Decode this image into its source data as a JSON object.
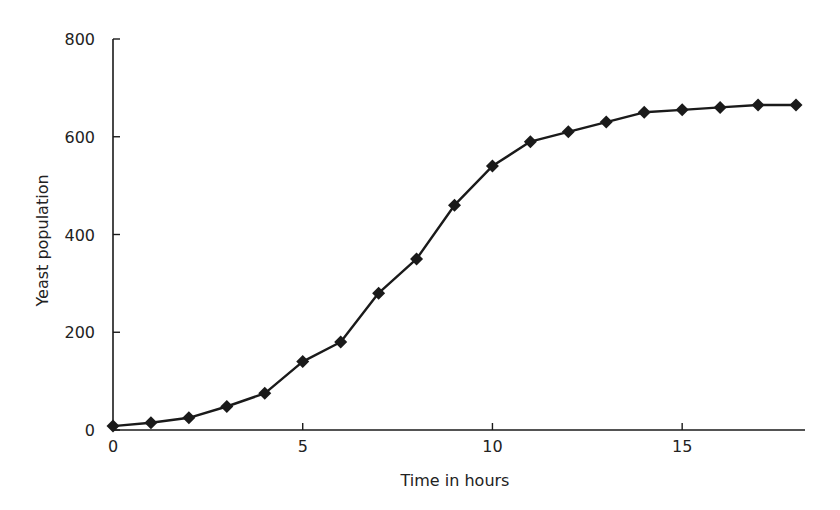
{
  "chart_data": {
    "type": "line",
    "title": "",
    "xlabel": "Time in hours",
    "ylabel": "Yeast population",
    "xlim": [
      0,
      18
    ],
    "ylim": [
      0,
      800
    ],
    "x_ticks": [
      0,
      5,
      10,
      15
    ],
    "y_ticks": [
      0,
      200,
      400,
      600,
      800
    ],
    "grid": false,
    "legend": null,
    "series": [
      {
        "name": "Yeast population",
        "marker": "diamond",
        "color": "#1a1a1a",
        "x": [
          0,
          1,
          2,
          3,
          4,
          5,
          6,
          7,
          8,
          9,
          10,
          11,
          12,
          13,
          14,
          15,
          16,
          17,
          18
        ],
        "values": [
          8,
          15,
          25,
          48,
          75,
          140,
          180,
          280,
          350,
          460,
          540,
          590,
          610,
          630,
          650,
          655,
          660,
          665,
          665
        ]
      }
    ]
  },
  "plot": {
    "left": 113,
    "right": 796,
    "axis_end": 805,
    "top": 39,
    "bottom": 430
  }
}
